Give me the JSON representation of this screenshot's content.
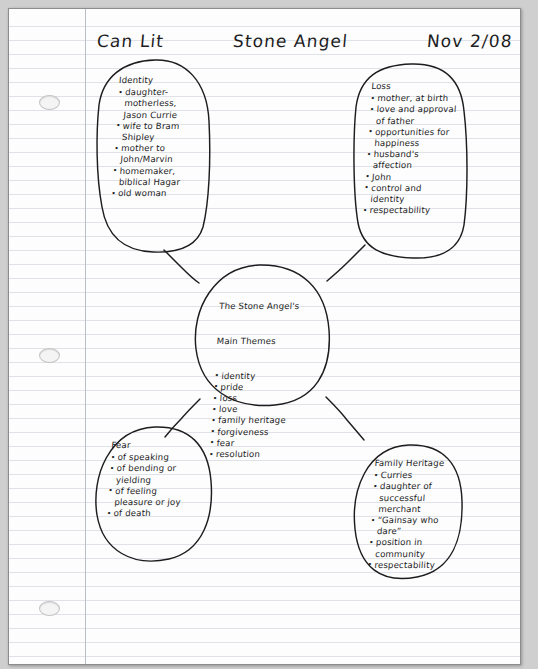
{
  "document": {
    "type": "handwritten-mind-map",
    "paper": "lined looseleaf, 3-hole punched"
  },
  "header": {
    "course": "Can Lit",
    "title": "Stone Angel",
    "date": "Nov 2/08"
  },
  "center": {
    "heading_line1": "The Stone Angel's",
    "heading_line2": "Main Themes",
    "items": [
      "identity",
      "pride",
      "loss",
      "love",
      "family heritage",
      "forgiveness",
      "fear",
      "resolution"
    ]
  },
  "bubbles": [
    {
      "id": "identity",
      "heading": "Identity",
      "items": [
        {
          "main": "daughter-",
          "cont": [
            "motherless,",
            "Jason Currie"
          ]
        },
        {
          "main": "wife to Bram",
          "cont": [
            "Shipley"
          ]
        },
        {
          "main": "mother to",
          "cont": [
            "John/Marvin"
          ]
        },
        {
          "main": "homemaker,",
          "cont": [
            "biblical Hagar"
          ]
        },
        {
          "main": "old woman",
          "cont": []
        }
      ]
    },
    {
      "id": "loss",
      "heading": "Loss",
      "items": [
        {
          "main": "mother, at birth",
          "cont": []
        },
        {
          "main": "love and approval",
          "cont": [
            "of father"
          ]
        },
        {
          "main": "opportunities for",
          "cont": [
            "happiness"
          ]
        },
        {
          "main": "husband's",
          "cont": [
            "affection"
          ]
        },
        {
          "main": "John",
          "cont": []
        },
        {
          "main": "control and",
          "cont": [
            "identity"
          ]
        },
        {
          "main": "respectability",
          "cont": []
        }
      ]
    },
    {
      "id": "fear",
      "heading": "Fear",
      "items": [
        {
          "main": "of speaking",
          "cont": []
        },
        {
          "main": "of bending or",
          "cont": [
            "yielding"
          ]
        },
        {
          "main": "of feeling",
          "cont": [
            "pleasure or joy"
          ]
        },
        {
          "main": "of death",
          "cont": []
        }
      ]
    },
    {
      "id": "family-heritage",
      "heading": "Family Heritage",
      "items": [
        {
          "main": "Curries",
          "cont": []
        },
        {
          "main": "daughter of",
          "cont": [
            "successful",
            "merchant"
          ]
        },
        {
          "main": "“Gainsay who",
          "cont": [
            "dare”"
          ]
        },
        {
          "main": "position in",
          "cont": [
            "community"
          ]
        },
        {
          "main": "respectability",
          "cont": []
        }
      ]
    }
  ],
  "connectors": [
    {
      "from": "center",
      "to": "identity"
    },
    {
      "from": "center",
      "to": "loss"
    },
    {
      "from": "center",
      "to": "fear"
    },
    {
      "from": "center",
      "to": "family-heritage"
    }
  ],
  "colors": {
    "ink": "#1d1d1f",
    "rule_line": "#dfe3e8",
    "margin_line": "#b9bfc6",
    "paper": "#fdfdfd",
    "backdrop": "#cfcfcf"
  }
}
